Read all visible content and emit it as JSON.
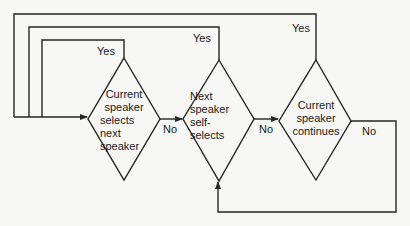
{
  "diagram": {
    "type": "flowchart",
    "colors": {
      "line": "#262626",
      "background": "#f7f7f5",
      "text": "#1a1a1a"
    },
    "nodes": [
      {
        "id": "d1",
        "shape": "diamond",
        "lines": [
          "Current",
          "speaker",
          "selects",
          "next",
          "speaker"
        ]
      },
      {
        "id": "d2",
        "shape": "diamond",
        "lines": [
          "Next",
          "speaker",
          "self-",
          "selects"
        ]
      },
      {
        "id": "d3",
        "shape": "diamond",
        "lines": [
          "Current",
          "speaker",
          "continues"
        ]
      }
    ],
    "edges": [
      {
        "from": "d1",
        "to": "d2",
        "label": "No"
      },
      {
        "from": "d2",
        "to": "d3",
        "label": "No"
      },
      {
        "from": "d3",
        "to": "d2",
        "label": "No"
      },
      {
        "from": "d1",
        "to": "d1",
        "label": "Yes"
      },
      {
        "from": "d2",
        "to": "d1",
        "label": "Yes"
      },
      {
        "from": "d3",
        "to": "d1",
        "label": "Yes"
      }
    ],
    "labels": {
      "yes1": "Yes",
      "yes2": "Yes",
      "yes3": "Yes",
      "no1": "No",
      "no2": "No",
      "no3": "No"
    }
  }
}
